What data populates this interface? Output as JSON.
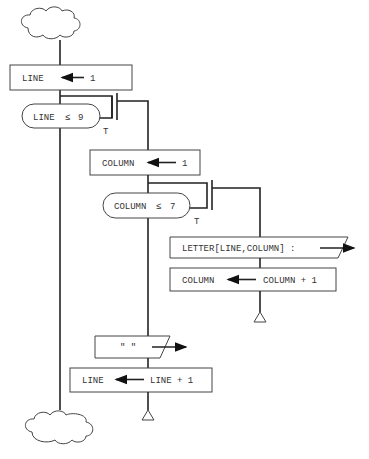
{
  "diagram": {
    "type": "flowchart (Nassi-style structured)",
    "start": {
      "shape": "cloud"
    },
    "end": {
      "shape": "cloud"
    },
    "nodes": [
      {
        "id": "init-line",
        "shape": "process",
        "target": "LINE",
        "value": "1"
      },
      {
        "id": "loop-line",
        "shape": "decision",
        "condition_var": "LINE",
        "condition_op": "≤",
        "condition_val": "9",
        "branch_label": "T"
      },
      {
        "id": "init-column",
        "shape": "process",
        "target": "COLUMN",
        "value": "1"
      },
      {
        "id": "loop-column",
        "shape": "decision",
        "condition_var": "COLUMN",
        "condition_op": "≤",
        "condition_val": "7",
        "branch_label": "T"
      },
      {
        "id": "output-letter",
        "shape": "output",
        "text": "LETTER[LINE,COLUMN] :"
      },
      {
        "id": "inc-column",
        "shape": "process",
        "target": "COLUMN",
        "value": "COLUMN + 1"
      },
      {
        "id": "output-blank",
        "shape": "output",
        "text": "\" \""
      },
      {
        "id": "inc-line",
        "shape": "process",
        "target": "LINE",
        "value": "LINE + 1"
      }
    ],
    "loop_ends": [
      {
        "id": "column-loop-end",
        "shape": "triangle"
      },
      {
        "id": "line-loop-end",
        "shape": "triangle"
      }
    ]
  },
  "colors": {
    "stroke": "#222222",
    "text": "#333333",
    "background": "#ffffff"
  }
}
